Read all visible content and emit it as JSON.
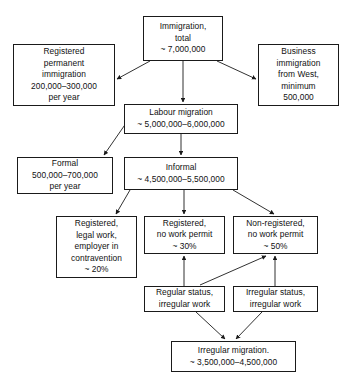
{
  "diagram": {
    "type": "flowchart",
    "stroke_color": "#1a1a1a",
    "background_color": "#ffffff",
    "nodes": [
      {
        "id": "immigration-total",
        "name": "immigration-total-box",
        "text": "Immigration,\ntotal\n~ 7,000,000",
        "x": 143,
        "y": 16,
        "w": 80,
        "h": 45
      },
      {
        "id": "registered-permanent",
        "name": "registered-permanent-immigration-box",
        "text": "Registered\npermanent\nimmigration\n200,000–300,000\nper year",
        "x": 13,
        "y": 44,
        "w": 102,
        "h": 62
      },
      {
        "id": "business-immigration",
        "name": "business-immigration-box",
        "text": "Business\nimmigration\nfrom West,\nminimum\n500,000",
        "x": 258,
        "y": 44,
        "w": 81,
        "h": 62
      },
      {
        "id": "labour-migration",
        "name": "labour-migration-box",
        "text": "Labour migration\n~ 5,000,000–6,000,000",
        "x": 124,
        "y": 104,
        "w": 114,
        "h": 30
      },
      {
        "id": "formal",
        "name": "formal-box",
        "text": "Formal\n500,000–700,000\nper year",
        "x": 17,
        "y": 157,
        "w": 96,
        "h": 37
      },
      {
        "id": "informal",
        "name": "informal-box",
        "text": "Informal\n~ 4,500,000–5,500,000",
        "x": 124,
        "y": 157,
        "w": 114,
        "h": 33
      },
      {
        "id": "registered-legal-work",
        "name": "registered-legal-work-box",
        "text": "Registered,\nlegal work,\nemployer in\ncontravention\n~ 20%",
        "x": 56,
        "y": 216,
        "w": 81,
        "h": 62
      },
      {
        "id": "registered-no-permit",
        "name": "registered-no-work-permit-box",
        "text": "Registered,\nno work permit\n~ 30%",
        "x": 144,
        "y": 216,
        "w": 81,
        "h": 38
      },
      {
        "id": "non-registered-no-permit",
        "name": "non-registered-no-work-permit-box",
        "text": "Non-registered,\nno work permit\n~ 50%",
        "x": 233,
        "y": 216,
        "w": 85,
        "h": 38
      },
      {
        "id": "regular-status",
        "name": "regular-status-irregular-work-box",
        "text": "Regular status,\nirregular work",
        "x": 144,
        "y": 286,
        "w": 81,
        "h": 26
      },
      {
        "id": "irregular-status",
        "name": "irregular-status-irregular-work-box",
        "text": "Irregular status,\nirregular work",
        "x": 233,
        "y": 286,
        "w": 85,
        "h": 26
      },
      {
        "id": "irregular-migration",
        "name": "irregular-migration-box",
        "text": "Irregular migration.\n~ 3,500,000–4,500,000",
        "x": 171,
        "y": 341,
        "w": 125,
        "h": 31
      }
    ],
    "edges": [
      {
        "id": "e1",
        "name": "edge-immigration-to-registered-permanent",
        "from": "immigration-total",
        "to": "registered-permanent",
        "path": "M 150,61 L 117,79"
      },
      {
        "id": "e2",
        "name": "edge-immigration-to-labour-migration",
        "from": "immigration-total",
        "to": "labour-migration",
        "path": "M 183,61 L 183,102"
      },
      {
        "id": "e3",
        "name": "edge-immigration-to-business",
        "from": "immigration-total",
        "to": "business-immigration",
        "path": "M 217,61 L 256,79"
      },
      {
        "id": "e4",
        "name": "edge-labour-to-formal",
        "from": "labour-migration",
        "to": "formal",
        "path": "M 131,116 L 104,155"
      },
      {
        "id": "e5",
        "name": "edge-labour-to-informal",
        "from": "labour-migration",
        "to": "informal",
        "path": "M 181,134 L 181,155"
      },
      {
        "id": "e6",
        "name": "edge-informal-to-registered-legal-work",
        "from": "informal",
        "to": "registered-legal-work",
        "path": "M 130,190 L 116,214"
      },
      {
        "id": "e7",
        "name": "edge-informal-to-registered-no-permit",
        "from": "informal",
        "to": "registered-no-permit",
        "path": "M 184,190 L 184,214"
      },
      {
        "id": "e8",
        "name": "edge-informal-to-non-registered",
        "from": "informal",
        "to": "non-registered-no-permit",
        "path": "M 233,190 L 274,214"
      },
      {
        "id": "e9",
        "name": "edge-regular-status-to-registered-no-permit",
        "from": "regular-status",
        "to": "registered-no-permit",
        "path": "M 184,286 L 184,256"
      },
      {
        "id": "e10",
        "name": "edge-regular-status-to-non-registered",
        "from": "regular-status",
        "to": "non-registered-no-permit",
        "path": "M 200,285 L 266,256"
      },
      {
        "id": "e11",
        "name": "edge-irregular-status-to-non-registered",
        "from": "irregular-status",
        "to": "non-registered-no-permit",
        "path": "M 275,286 L 275,256"
      },
      {
        "id": "e12",
        "name": "edge-regular-status-to-irregular-migration",
        "from": "regular-status",
        "to": "irregular-migration",
        "path": "M 196,312 L 225,339"
      },
      {
        "id": "e13",
        "name": "edge-irregular-status-to-irregular-migration",
        "from": "irregular-status",
        "to": "irregular-migration",
        "path": "M 262,312 L 236,339"
      }
    ]
  }
}
